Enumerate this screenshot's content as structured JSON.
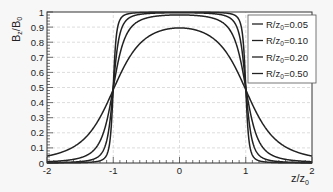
{
  "chart_data": {
    "type": "line",
    "title": "",
    "xlabel": "z/z0",
    "ylabel": "Bz/B0",
    "xlim": [
      -2,
      2
    ],
    "ylim": [
      0,
      1
    ],
    "xticks": [
      -2,
      -1,
      0,
      1,
      2
    ],
    "yticks": [
      0,
      0.1,
      0.2,
      0.3,
      0.4,
      0.5,
      0.6,
      0.7,
      0.8,
      0.9,
      1
    ],
    "grid": true,
    "legend_position": "upper right",
    "x": [
      -2,
      -1.75,
      -1.5,
      -1.3,
      -1.2,
      -1.1,
      -1.05,
      -1.0,
      -0.95,
      -0.9,
      -0.8,
      -0.7,
      -0.5,
      -0.25,
      0,
      0.25,
      0.5,
      0.7,
      0.8,
      0.9,
      0.95,
      1.0,
      1.05,
      1.1,
      1.2,
      1.3,
      1.5,
      1.75,
      2
    ],
    "series": [
      {
        "name": "R/z0=0.05",
        "values": [
          0.001,
          0.001,
          0.002,
          0.006,
          0.012,
          0.047,
          0.146,
          0.499,
          0.853,
          0.952,
          0.988,
          0.995,
          0.998,
          0.999,
          0.999,
          0.999,
          0.998,
          0.995,
          0.988,
          0.952,
          0.853,
          0.499,
          0.146,
          0.047,
          0.012,
          0.006,
          0.002,
          0.001,
          0.001
        ]
      },
      {
        "name": "R/z0=0.10",
        "values": [
          0.002,
          0.004,
          0.009,
          0.023,
          0.045,
          0.146,
          0.277,
          0.499,
          0.722,
          0.852,
          0.951,
          0.977,
          0.991,
          0.995,
          0.995,
          0.995,
          0.991,
          0.977,
          0.951,
          0.852,
          0.722,
          0.499,
          0.277,
          0.146,
          0.045,
          0.023,
          0.009,
          0.004,
          0.002
        ]
      },
      {
        "name": "R/z0=0.20",
        "values": [
          0.009,
          0.017,
          0.035,
          0.079,
          0.145,
          0.277,
          0.38,
          0.495,
          0.609,
          0.711,
          0.848,
          0.914,
          0.962,
          0.978,
          0.981,
          0.978,
          0.962,
          0.914,
          0.848,
          0.711,
          0.609,
          0.495,
          0.38,
          0.277,
          0.145,
          0.079,
          0.035,
          0.017,
          0.009
        ]
      },
      {
        "name": "R/z0=0.50",
        "values": [
          0.043,
          0.075,
          0.129,
          0.205,
          0.267,
          0.347,
          0.394,
          0.442,
          0.488,
          0.532,
          0.609,
          0.672,
          0.763,
          0.841,
          0.894,
          0.841,
          0.763,
          0.672,
          0.609,
          0.532,
          0.488,
          0.442,
          0.394,
          0.347,
          0.267,
          0.205,
          0.129,
          0.075,
          0.043
        ]
      }
    ],
    "r_values": [
      0.05,
      0.1,
      0.2,
      0.5
    ]
  },
  "labels": {
    "xlabel_main": "z/z",
    "xlabel_sub": "0",
    "ylabel_main": "B",
    "ylabel_sub1": "z",
    "ylabel_mid": "/B",
    "ylabel_sub2": "0",
    "xtick_labels": [
      "-2",
      "-1",
      "0",
      "1",
      "2"
    ],
    "ytick_labels": [
      "0",
      "0.1",
      "0.2",
      "0.3",
      "0.4",
      "0.5",
      "0.6",
      "0.7",
      "0.8",
      "0.9",
      "1"
    ],
    "legend": [
      {
        "prefix": "R/z",
        "sub": "0",
        "suffix": "=0.05"
      },
      {
        "prefix": "R/z",
        "sub": "0",
        "suffix": "=0.10"
      },
      {
        "prefix": "R/z",
        "sub": "0",
        "suffix": "=0.20"
      },
      {
        "prefix": "R/z",
        "sub": "0",
        "suffix": "=0.50"
      }
    ]
  },
  "colors": {
    "curve": "#222222",
    "grid": "#cfcfcf",
    "frame": "#333333",
    "background": "#ffffff"
  }
}
